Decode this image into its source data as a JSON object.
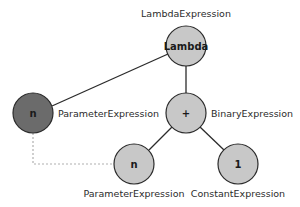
{
  "diagram": {
    "nodes": [
      {
        "id": "lambda",
        "text": "Lambda",
        "label": "LambdaExpression",
        "fill": "#c8c8c8"
      },
      {
        "id": "param_root",
        "text": "n",
        "label": "ParameterExpression",
        "fill": "#6b6b6b"
      },
      {
        "id": "binary",
        "text": "+",
        "label": "BinaryExpression",
        "fill": "#c8c8c8"
      },
      {
        "id": "param_ref",
        "text": "n",
        "label": "ParameterExpression",
        "fill": "#c8c8c8"
      },
      {
        "id": "constant",
        "text": "1",
        "label": "ConstantExpression",
        "fill": "#c8c8c8"
      }
    ],
    "edges": [
      {
        "from": "lambda",
        "to": "param_root",
        "style": "solid"
      },
      {
        "from": "lambda",
        "to": "binary",
        "style": "solid"
      },
      {
        "from": "binary",
        "to": "param_ref",
        "style": "solid"
      },
      {
        "from": "binary",
        "to": "constant",
        "style": "solid"
      },
      {
        "from": "param_root",
        "to": "param_ref",
        "style": "dashed"
      }
    ],
    "colors": {
      "node_fill": "#c8c8c8",
      "node_fill_dark": "#6b6b6b",
      "stroke": "#2b2b2b",
      "dashed": "#b0b0b0"
    }
  }
}
